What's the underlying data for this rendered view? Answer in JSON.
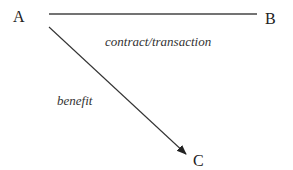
{
  "diagram": {
    "nodes": [
      {
        "id": "A",
        "label": "A"
      },
      {
        "id": "B",
        "label": "B"
      },
      {
        "id": "C",
        "label": "C"
      }
    ],
    "edges": [
      {
        "from": "A",
        "to": "B",
        "label": "contract/transaction",
        "style": "line",
        "directed": false
      },
      {
        "from": "A",
        "to": "C",
        "label": "benefit",
        "style": "arrow",
        "directed": true
      }
    ],
    "colors": {
      "stroke": "#333333",
      "text": "#222222",
      "background": "#ffffff"
    }
  }
}
